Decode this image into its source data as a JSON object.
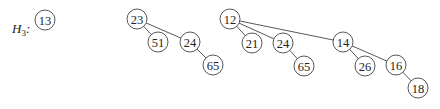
{
  "heap": {
    "label": "H",
    "subscript": "3",
    "suffix": ":"
  },
  "style": {
    "stroke": "#444444",
    "node_fill": "#ffffff",
    "text": "#222222",
    "radius": 10
  },
  "nodes": [
    {
      "id": "n13",
      "key": "13",
      "x": 45,
      "y": 20
    },
    {
      "id": "n23",
      "key": "23",
      "x": 137,
      "y": 19
    },
    {
      "id": "n51",
      "key": "51",
      "x": 158,
      "y": 42
    },
    {
      "id": "n24a",
      "key": "24",
      "x": 190,
      "y": 42
    },
    {
      "id": "n65a",
      "key": "65",
      "x": 213,
      "y": 65
    },
    {
      "id": "n12",
      "key": "12",
      "x": 230,
      "y": 19
    },
    {
      "id": "n21",
      "key": "21",
      "x": 252,
      "y": 43
    },
    {
      "id": "n24b",
      "key": "24",
      "x": 283,
      "y": 43
    },
    {
      "id": "n65b",
      "key": "65",
      "x": 304,
      "y": 66
    },
    {
      "id": "n14",
      "key": "14",
      "x": 343,
      "y": 42
    },
    {
      "id": "n26",
      "key": "26",
      "x": 365,
      "y": 66
    },
    {
      "id": "n16",
      "key": "16",
      "x": 396,
      "y": 65
    },
    {
      "id": "n18",
      "key": "18",
      "x": 418,
      "y": 88
    }
  ],
  "edges": [
    {
      "from": "n23",
      "to": "n51"
    },
    {
      "from": "n23",
      "to": "n24a"
    },
    {
      "from": "n24a",
      "to": "n65a"
    },
    {
      "from": "n12",
      "to": "n21"
    },
    {
      "from": "n12",
      "to": "n24b"
    },
    {
      "from": "n12",
      "to": "n14"
    },
    {
      "from": "n24b",
      "to": "n65b"
    },
    {
      "from": "n14",
      "to": "n26"
    },
    {
      "from": "n14",
      "to": "n16"
    },
    {
      "from": "n16",
      "to": "n18"
    }
  ],
  "trees": [
    {
      "root": "n13",
      "degree": 0
    },
    {
      "root": "n23",
      "degree": 2
    },
    {
      "root": "n12",
      "degree": 3
    }
  ]
}
